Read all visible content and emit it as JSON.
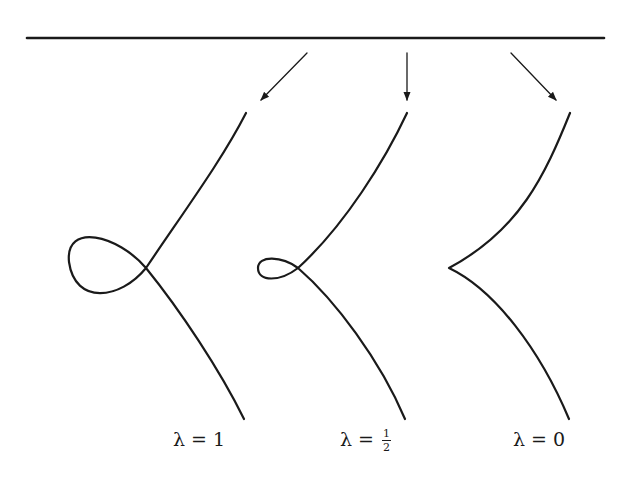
{
  "diagram": {
    "stroke_color": "#1a1a1a",
    "background_color": "#ffffff",
    "baseline": {
      "x1": 27,
      "y1": 38,
      "x2": 604,
      "y2": 38
    },
    "arrows": [
      {
        "x1": 307,
        "y1": 53,
        "x2": 261,
        "y2": 100
      },
      {
        "x1": 407,
        "y1": 53,
        "x2": 407,
        "y2": 100
      },
      {
        "x1": 511,
        "y1": 53,
        "x2": 556,
        "y2": 100
      }
    ],
    "curves": [
      {
        "name": "loop-curve",
        "path": "M246,113 C222,160 185,210 146,268 C120,300 75,305 69,262 C65,222 118,235 146,268 C180,310 220,370 244,419"
      },
      {
        "name": "small-loop-curve",
        "path": "M407,113 C385,160 345,225 298,268 C280,282 258,282 258,268 C258,255 282,256 298,268 C335,300 380,360 405,419"
      },
      {
        "name": "cusp-curve",
        "path": "M570,113 C545,175 520,230 449,268 C495,290 540,350 569,419"
      }
    ],
    "labels": [
      {
        "symbol": "λ",
        "equals": "=",
        "value": "1"
      },
      {
        "symbol": "λ",
        "equals": "=",
        "numerator": "1",
        "denominator": "2"
      },
      {
        "symbol": "λ",
        "equals": "=",
        "value": "0"
      }
    ]
  }
}
